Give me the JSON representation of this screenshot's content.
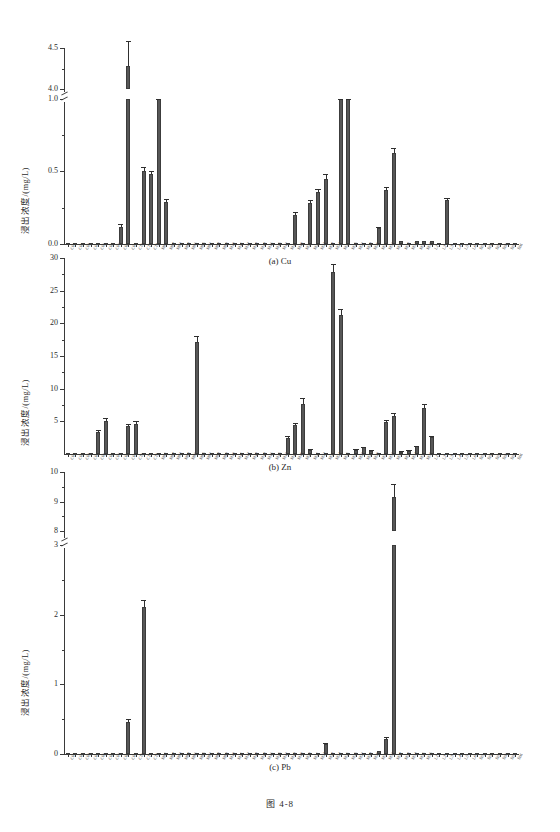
{
  "figure": {
    "caption": "图 4-8",
    "ylabel": "浸出浓度/(mg/L)"
  },
  "panels": [
    {
      "id": "a",
      "caption": "(a) Cu"
    },
    {
      "id": "b",
      "caption": "(b) Zn"
    },
    {
      "id": "c",
      "caption": "(c) Pb"
    }
  ],
  "categories": [
    "C01",
    "C02",
    "C03",
    "C04",
    "C05",
    "C06",
    "C07",
    "C08",
    "C09",
    "C10",
    "C11",
    "C12",
    "M01",
    "M02",
    "M03",
    "M04",
    "M05",
    "M06",
    "M07",
    "M08",
    "M09",
    "M10",
    "M11",
    "M12",
    "M13",
    "M14",
    "M15",
    "M16",
    "M17",
    "M18",
    "M19",
    "M20",
    "M21",
    "M22",
    "M23",
    "M24",
    "M25",
    "M26",
    "M27",
    "M28",
    "M29",
    "M30",
    "M31",
    "M32",
    "M33",
    "M34",
    "M35",
    "M36",
    "L1",
    "L2",
    "L3",
    "L4",
    "L5",
    "L6",
    "S01",
    "S02",
    "S03",
    "S04",
    "S05",
    "S06"
  ],
  "chart_data": [
    {
      "type": "bar",
      "panel": "a",
      "title": "(a) Cu",
      "xlabel": "",
      "ylabel": "浸出浓度/(mg/L)",
      "ylim": [
        0,
        4.5
      ],
      "axis_break": {
        "lower_max": 1.0,
        "upper_min": 4.0
      },
      "yticks": [
        0.0,
        0.5,
        1.0,
        4.0,
        4.5
      ],
      "ytick_labels": [
        "0.0",
        "0.5",
        "1.0",
        "4.0",
        "4.5"
      ],
      "grid": false,
      "legend": "none",
      "categories": [
        "C01",
        "C02",
        "C03",
        "C04",
        "C05",
        "C06",
        "C07",
        "C08",
        "C09",
        "C10",
        "C11",
        "C12",
        "M01",
        "M02",
        "M03",
        "M04",
        "M05",
        "M06",
        "M07",
        "M08",
        "M09",
        "M10",
        "M11",
        "M12",
        "M13",
        "M14",
        "M15",
        "M16",
        "M17",
        "M18",
        "M19",
        "M20",
        "M21",
        "M22",
        "M23",
        "M24",
        "M25",
        "M26",
        "M27",
        "M28",
        "M29",
        "M30",
        "M31",
        "M32",
        "M33",
        "M34",
        "M35",
        "M36",
        "L1",
        "L2",
        "L3",
        "L4",
        "L5",
        "L6",
        "S01",
        "S02",
        "S03",
        "S04",
        "S05",
        "S06"
      ],
      "values": [
        0.01,
        0.01,
        0.01,
        0.01,
        0.01,
        0.01,
        0.01,
        0.12,
        4.28,
        0.01,
        0.5,
        0.48,
        1.17,
        0.29,
        0.01,
        0.01,
        0.01,
        0.01,
        0.01,
        0.01,
        0.01,
        0.01,
        0.01,
        0.01,
        0.01,
        0.01,
        0.01,
        0.01,
        0.01,
        0.01,
        0.2,
        0.01,
        0.28,
        0.36,
        0.45,
        0.01,
        1.12,
        1.14,
        0.01,
        0.01,
        0.01,
        0.11,
        0.37,
        0.63,
        0.02,
        0.01,
        0.02,
        0.02,
        0.02,
        0.01,
        0.3,
        0.01,
        0.01,
        0.01,
        0.01,
        0.01,
        0.01,
        0.01,
        0.01,
        0.01
      ],
      "errors": [
        0,
        0,
        0,
        0,
        0,
        0,
        0,
        0.02,
        0.3,
        0,
        0.03,
        0.02,
        0.05,
        0.02,
        0,
        0,
        0,
        0,
        0,
        0,
        0,
        0,
        0,
        0,
        0,
        0,
        0,
        0,
        0,
        0,
        0.02,
        0,
        0.02,
        0.02,
        0.03,
        0,
        0.03,
        0.03,
        0,
        0,
        0,
        0.01,
        0.02,
        0.03,
        0,
        0,
        0,
        0,
        0,
        0,
        0.02,
        0,
        0,
        0,
        0,
        0,
        0,
        0,
        0,
        0
      ]
    },
    {
      "type": "bar",
      "panel": "b",
      "title": "(b) Zn",
      "xlabel": "",
      "ylabel": "浸出浓度/(mg/L)",
      "ylim": [
        0,
        30
      ],
      "axis_break": null,
      "yticks": [
        5,
        10,
        15,
        20,
        25,
        30
      ],
      "ytick_labels": [
        "5",
        "10",
        "15",
        "20",
        "25",
        "30"
      ],
      "grid": false,
      "legend": "none",
      "categories": [
        "C01",
        "C02",
        "C03",
        "C04",
        "C05",
        "C06",
        "C07",
        "C08",
        "C09",
        "C10",
        "C11",
        "C12",
        "M01",
        "M02",
        "M03",
        "M04",
        "M05",
        "M06",
        "M07",
        "M08",
        "M09",
        "M10",
        "M11",
        "M12",
        "M13",
        "M14",
        "M15",
        "M16",
        "M17",
        "M18",
        "M19",
        "M20",
        "M21",
        "M22",
        "M23",
        "M24",
        "M25",
        "M26",
        "M27",
        "M28",
        "M29",
        "M30",
        "M31",
        "M32",
        "M33",
        "M34",
        "M35",
        "M36",
        "L1",
        "L2",
        "L3",
        "L4",
        "L5",
        "L6",
        "S01",
        "S02",
        "S03",
        "S04",
        "S05",
        "S06"
      ],
      "values": [
        0.1,
        0.1,
        0.1,
        0.1,
        3.4,
        5.1,
        0.1,
        0.1,
        4.3,
        4.6,
        0.1,
        0.1,
        0.1,
        0.1,
        0.1,
        0.1,
        0.1,
        17.1,
        0.1,
        0.1,
        0.1,
        0.1,
        0.1,
        0.1,
        0.1,
        0.1,
        0.1,
        0.1,
        0.1,
        2.5,
        4.4,
        7.6,
        0.6,
        0.1,
        0.1,
        27.9,
        21.3,
        0.1,
        0.6,
        1.0,
        0.5,
        0.1,
        4.9,
        5.8,
        0.3,
        0.5,
        1.2,
        7.1,
        2.6,
        0.1,
        0.1,
        0.1,
        0.1,
        0.1,
        0.1,
        0.1,
        0.1,
        0.1,
        0.1,
        0.1
      ],
      "errors": [
        0,
        0,
        0,
        0,
        0.3,
        0.4,
        0,
        0,
        0.3,
        0.4,
        0,
        0,
        0,
        0,
        0,
        0,
        0,
        0.9,
        0,
        0,
        0,
        0,
        0,
        0,
        0,
        0,
        0,
        0,
        0,
        0.2,
        0.3,
        0.9,
        0.1,
        0,
        0,
        1.2,
        0.9,
        0,
        0.1,
        0.1,
        0.1,
        0,
        0.3,
        0.4,
        0.1,
        0.1,
        0.1,
        0.5,
        0.2,
        0,
        0,
        0,
        0,
        0,
        0,
        0,
        0,
        0,
        0,
        0
      ]
    },
    {
      "type": "bar",
      "panel": "c",
      "title": "(c) Pb",
      "xlabel": "",
      "ylabel": "浸出浓度/(mg/L)",
      "ylim": [
        0,
        10
      ],
      "axis_break": {
        "lower_max": 3,
        "upper_min": 8
      },
      "yticks": [
        0,
        1,
        2,
        3,
        8,
        9,
        10
      ],
      "ytick_labels": [
        "0",
        "1",
        "2",
        "3",
        "8",
        "9",
        "10"
      ],
      "grid": false,
      "legend": "none",
      "categories": [
        "C01",
        "C02",
        "C03",
        "C04",
        "C05",
        "C06",
        "C07",
        "C08",
        "C09",
        "C10",
        "C11",
        "C12",
        "M01",
        "M02",
        "M03",
        "M04",
        "M05",
        "M06",
        "M07",
        "M08",
        "M09",
        "M10",
        "M11",
        "M12",
        "M13",
        "M14",
        "M15",
        "M16",
        "M17",
        "M18",
        "M19",
        "M20",
        "M21",
        "M22",
        "M23",
        "M24",
        "M25",
        "M26",
        "M27",
        "M28",
        "M29",
        "M30",
        "M31",
        "M32",
        "M33",
        "M34",
        "M35",
        "M36",
        "L1",
        "L2",
        "L3",
        "L4",
        "L5",
        "L6",
        "S01",
        "S02",
        "S03",
        "S04",
        "S05",
        "S06"
      ],
      "values": [
        0.01,
        0.01,
        0.01,
        0.01,
        0.01,
        0.01,
        0.01,
        0.01,
        0.46,
        0.01,
        2.12,
        0.01,
        0.01,
        0.01,
        0.01,
        0.01,
        0.01,
        0.01,
        0.01,
        0.01,
        0.01,
        0.01,
        0.01,
        0.01,
        0.01,
        0.01,
        0.01,
        0.01,
        0.01,
        0.01,
        0.01,
        0.01,
        0.01,
        0.01,
        0.15,
        0.01,
        0.01,
        0.01,
        0.01,
        0.01,
        0.01,
        0.04,
        0.22,
        9.15,
        0.01,
        0.01,
        0.01,
        0.01,
        0.01,
        0.01,
        0.01,
        0.01,
        0.01,
        0.01,
        0.01,
        0.01,
        0.01,
        0.01,
        0.01,
        0.01
      ],
      "errors": [
        0,
        0,
        0,
        0,
        0,
        0,
        0,
        0,
        0.05,
        0,
        0.1,
        0,
        0,
        0,
        0,
        0,
        0,
        0,
        0,
        0,
        0,
        0,
        0,
        0,
        0,
        0,
        0,
        0,
        0,
        0,
        0,
        0,
        0,
        0,
        0.01,
        0,
        0,
        0,
        0,
        0,
        0,
        0,
        0.02,
        0.45,
        0,
        0,
        0,
        0
      ]
    }
  ],
  "colors": {
    "bar_fill": "#575757",
    "bar_edge": "#3c3c3c",
    "axis": "#3a3a3a",
    "text": "#2b2b2b",
    "background": "#ffffff"
  }
}
